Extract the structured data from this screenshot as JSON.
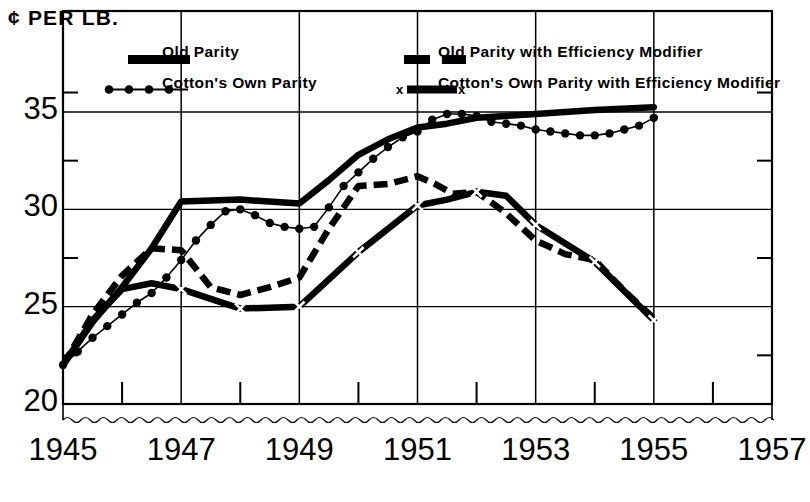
{
  "axis_title": "¢ PER LB.",
  "legend": [
    {
      "id": "old-parity",
      "label": "Old Parity",
      "style": "solid"
    },
    {
      "id": "old-parity-em",
      "label": "Old Parity with Efficiency Modifier",
      "style": "dashed"
    },
    {
      "id": "cotton-own",
      "label": "Cotton's Own Parity",
      "style": "dotted"
    },
    {
      "id": "cotton-own-em",
      "label": "Cotton's Own Parity with Efficiency Modifier",
      "style": "solid-x"
    }
  ],
  "chart_data": {
    "type": "line",
    "title": "",
    "xlabel": "",
    "ylabel": "¢ PER LB.",
    "xlim": [
      1945,
      1957
    ],
    "ylim": [
      20,
      36.2
    ],
    "grid": true,
    "y_major_ticks": [
      20,
      25,
      30,
      35
    ],
    "y_minor_ticks": [
      22.5,
      27.5,
      32.5
    ],
    "y_tick_labels": [
      "20",
      "25",
      "30",
      "35"
    ],
    "x_major_ticks": [
      1945,
      1947,
      1949,
      1951,
      1953,
      1955,
      1957
    ],
    "x_minor_ticks": [
      1946,
      1948,
      1950,
      1952,
      1954,
      1956
    ],
    "x_tick_labels": [
      "1945",
      "1947",
      "1949",
      "1951",
      "1953",
      "1955",
      "1957"
    ],
    "axis_break": true,
    "legend_position": "top",
    "series": [
      {
        "name": "Old Parity",
        "style": "solid",
        "x": [
          1945.0,
          1945.5,
          1946.0,
          1946.5,
          1947.0,
          1948.0,
          1949.0,
          1949.5,
          1950.0,
          1950.5,
          1951.0,
          1951.5,
          1952.0,
          1952.5,
          1953.0,
          1954.0,
          1955.0
        ],
        "y": [
          22.0,
          24.2,
          26.0,
          28.0,
          30.4,
          30.5,
          30.3,
          31.5,
          32.8,
          33.6,
          34.2,
          34.4,
          34.7,
          34.8,
          34.9,
          35.1,
          35.25
        ]
      },
      {
        "name": "Old Parity with Efficiency Modifier",
        "style": "dashed",
        "x": [
          1945.0,
          1945.5,
          1946.0,
          1946.5,
          1947.0,
          1947.5,
          1948.0,
          1948.5,
          1949.0,
          1949.5,
          1950.0,
          1950.5,
          1951.0,
          1951.3,
          1951.6,
          1952.0,
          1952.5,
          1953.0,
          1953.5,
          1954.0,
          1954.5,
          1955.0
        ],
        "y": [
          22.0,
          24.6,
          26.6,
          28.0,
          27.9,
          26.0,
          25.6,
          26.0,
          26.5,
          29.0,
          31.2,
          31.3,
          31.7,
          31.3,
          30.8,
          30.9,
          29.8,
          28.4,
          27.7,
          27.4,
          25.8,
          24.4
        ]
      },
      {
        "name": "Cotton's Own Parity",
        "style": "dotted",
        "x": [
          1945.0,
          1945.25,
          1945.5,
          1945.75,
          1946.0,
          1946.25,
          1946.5,
          1946.75,
          1947.0,
          1947.25,
          1947.5,
          1947.75,
          1948.0,
          1948.25,
          1948.5,
          1948.75,
          1949.0,
          1949.25,
          1949.5,
          1949.75,
          1950.0,
          1950.25,
          1950.5,
          1950.75,
          1951.0,
          1951.25,
          1951.5,
          1951.75,
          1952.0,
          1952.25,
          1952.5,
          1952.75,
          1953.0,
          1953.25,
          1953.5,
          1953.75,
          1954.0,
          1954.25,
          1954.5,
          1954.75,
          1955.0
        ],
        "y": [
          22.0,
          22.7,
          23.4,
          24.0,
          24.6,
          25.2,
          25.7,
          26.5,
          27.4,
          28.4,
          29.2,
          29.9,
          30.0,
          29.7,
          29.3,
          29.1,
          29.0,
          29.1,
          30.1,
          31.2,
          31.9,
          32.6,
          33.2,
          33.7,
          34.0,
          34.6,
          34.9,
          34.9,
          34.8,
          34.5,
          34.4,
          34.3,
          34.1,
          34.0,
          33.9,
          33.8,
          33.8,
          33.9,
          34.1,
          34.3,
          34.7
        ]
      },
      {
        "name": "Cotton's Own Parity with Efficiency Modifier",
        "style": "solid-x",
        "x": [
          1945.0,
          1945.5,
          1946.0,
          1946.5,
          1947.0,
          1948.0,
          1949.0,
          1950.0,
          1951.0,
          1951.5,
          1952.0,
          1952.5,
          1953.0,
          1954.0,
          1955.0
        ],
        "y": [
          22.0,
          24.3,
          25.9,
          26.2,
          25.9,
          24.9,
          25.0,
          27.8,
          30.2,
          30.5,
          30.9,
          30.7,
          29.2,
          27.3,
          24.3
        ],
        "marker_x": [
          1947.0,
          1948.0,
          1949.0,
          1950.0,
          1951.0,
          1952.0,
          1953.0,
          1954.0,
          1955.0
        ],
        "marker_y": [
          25.9,
          24.9,
          25.0,
          27.8,
          30.2,
          30.9,
          29.2,
          27.3,
          24.3
        ]
      }
    ]
  }
}
